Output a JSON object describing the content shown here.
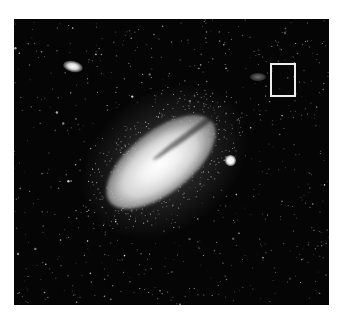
{
  "image": {
    "subject": "spiral galaxy star field photograph",
    "background_color": "#050505",
    "frame_color": "#ffffff"
  },
  "annotation": {
    "type": "rectangle",
    "color": "#eeeeee"
  }
}
